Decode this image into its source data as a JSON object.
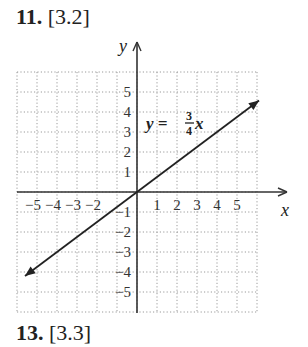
{
  "problems": [
    {
      "number": "11.",
      "section": "[3.2]"
    },
    {
      "number": "13.",
      "section": "[3.3]"
    }
  ],
  "chart_data": {
    "type": "line",
    "title": "",
    "equation": {
      "lhs": "y =",
      "num": "3",
      "den": "4",
      "var": "x"
    },
    "xlabel": "x",
    "ylabel": "y",
    "xlim": [
      -6,
      6
    ],
    "ylim": [
      -6,
      6
    ],
    "grid": true,
    "grid_style": "dotted",
    "x_ticks": [
      "−5",
      "−4",
      "−3",
      "−2",
      "1",
      "2",
      "3",
      "4",
      "5"
    ],
    "y_ticks": [
      "5",
      "4",
      "3",
      "2",
      "1",
      "−1",
      "−2",
      "−3",
      "−4",
      "−5"
    ],
    "series": [
      {
        "name": "y = 3/4 x",
        "slope": 0.75,
        "intercept": 0,
        "x": [
          -6,
          0,
          6
        ],
        "y": [
          -4.5,
          0,
          4.5
        ],
        "arrows": "both"
      }
    ]
  }
}
